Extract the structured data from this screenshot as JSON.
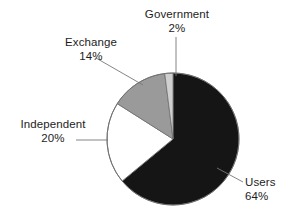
{
  "chart_data": {
    "type": "pie",
    "title": "",
    "categories": [
      "Users",
      "Independent",
      "Exchange",
      "Government"
    ],
    "values": [
      64,
      20,
      14,
      2
    ],
    "unit": "%",
    "labels": [
      {
        "name": "Users",
        "value": "64%",
        "pct": 64,
        "color": "#151515",
        "leader": "diagonal-up-left"
      },
      {
        "name": "Independent",
        "value": "20%",
        "pct": 20,
        "color": "#ffffff",
        "leader": "horizontal-right"
      },
      {
        "name": "Exchange",
        "value": "14%",
        "pct": 14,
        "color": "#9a9a9a",
        "leader": "diagonal-down-right"
      },
      {
        "name": "Government",
        "value": "2%",
        "pct": 2,
        "color": "#cfcfcf",
        "leader": "vertical-down"
      }
    ],
    "start_angle_deg": 0,
    "direction": "clockwise",
    "legend": "none",
    "grid": false,
    "colors": {
      "users": "#151515",
      "independent": "#ffffff",
      "exchange": "#9a9a9a",
      "government": "#cfcfcf",
      "outline": "#6e6e6e",
      "leader_line": "#777777",
      "text": "#1d1d1d",
      "background": "#ffffff"
    },
    "geometry": {
      "center_x": 173,
      "center_y": 139,
      "radius": 66
    }
  },
  "labels": {
    "government": {
      "name": "Government",
      "value": "2%"
    },
    "exchange": {
      "name": "Exchange",
      "value": "14%"
    },
    "independent": {
      "name": "Independent",
      "value": "20%"
    },
    "users": {
      "name": "Users",
      "value": "64%"
    }
  }
}
